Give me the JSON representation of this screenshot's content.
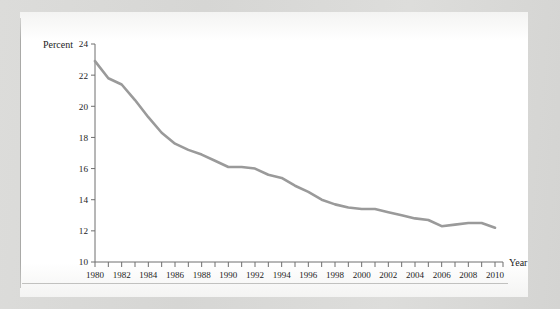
{
  "figure": {
    "y_axis_title": "Percent",
    "x_axis_title": "Year",
    "line_color": "#9a9a9a",
    "axis_color": "#6e6e6e",
    "page_color": "#ffffff",
    "scan_background_color": "#d8d8d6"
  },
  "chart_data": {
    "type": "line",
    "title": "",
    "subtitle": "",
    "xlabel": "Year",
    "ylabel": "Percent",
    "xlim": [
      1980,
      2010
    ],
    "ylim": [
      10,
      24
    ],
    "ytick_labels": [
      "24",
      "22",
      "20",
      "18",
      "16",
      "14",
      "12",
      "10"
    ],
    "ytick_values": [
      24,
      22,
      20,
      18,
      16,
      14,
      12,
      10
    ],
    "xtick_labels": [
      "1980",
      "1982",
      "1984",
      "1986",
      "1988",
      "1990",
      "1992",
      "1994",
      "1996",
      "1998",
      "2000",
      "2002",
      "2004",
      "2006",
      "2008",
      "2010"
    ],
    "xtick_values": [
      1980,
      1982,
      1984,
      1986,
      1988,
      1990,
      1992,
      1994,
      1996,
      1998,
      2000,
      2002,
      2004,
      2006,
      2008,
      2010
    ],
    "minor_xticks_every_years": 1,
    "grid": false,
    "legend": "none",
    "x": [
      1980,
      1981,
      1982,
      1983,
      1984,
      1985,
      1986,
      1987,
      1988,
      1989,
      1990,
      1991,
      1992,
      1993,
      1994,
      1995,
      1996,
      1997,
      1998,
      1999,
      2000,
      2001,
      2002,
      2003,
      2004,
      2005,
      2006,
      2007,
      2008,
      2009,
      2010
    ],
    "values": [
      22.9,
      21.8,
      21.4,
      20.4,
      19.3,
      18.3,
      17.6,
      17.2,
      16.9,
      16.5,
      16.1,
      16.1,
      16.0,
      15.6,
      15.4,
      14.9,
      14.5,
      14.0,
      13.7,
      13.5,
      13.4,
      13.4,
      13.2,
      13.0,
      12.8,
      12.7,
      12.3,
      12.4,
      12.5,
      12.5,
      12.2
    ],
    "series_name": "Percent"
  }
}
